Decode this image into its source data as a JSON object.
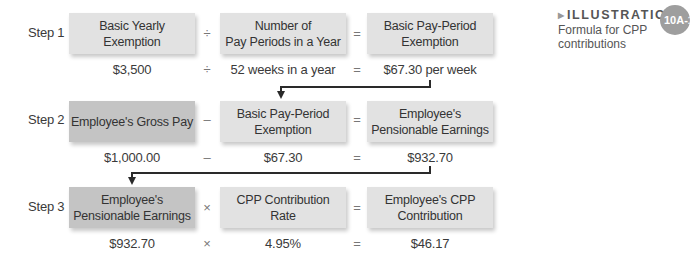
{
  "illustration": {
    "label": "ILLUSTRATION",
    "number": "10A-1",
    "subtitle_line1": "Formula for CPP",
    "subtitle_line2": "contributions"
  },
  "steps": [
    {
      "label": "Step 1",
      "boxes": [
        {
          "line1": "Basic Yearly",
          "line2": "Exemption",
          "shade": "light"
        },
        {
          "line1": "Number of",
          "line2": "Pay Periods in a Year",
          "shade": "light"
        },
        {
          "line1": "Basic Pay-Period",
          "line2": "Exemption",
          "shade": "light"
        }
      ],
      "operators": [
        "÷",
        "="
      ],
      "values": [
        "$3,500",
        "52 weeks in a year",
        "$67.30 per week"
      ],
      "value_operators": [
        "÷",
        "="
      ]
    },
    {
      "label": "Step 2",
      "boxes": [
        {
          "line1": "Employee's Gross Pay",
          "line2": "",
          "shade": "dark"
        },
        {
          "line1": "Basic Pay-Period",
          "line2": "Exemption",
          "shade": "light"
        },
        {
          "line1": "Employee's",
          "line2": "Pensionable Earnings",
          "shade": "light"
        }
      ],
      "operators": [
        "–",
        "="
      ],
      "values": [
        "$1,000.00",
        "$67.30",
        "$932.70"
      ],
      "value_operators": [
        "–",
        "="
      ]
    },
    {
      "label": "Step 3",
      "boxes": [
        {
          "line1": "Employee's",
          "line2": "Pensionable Earnings",
          "shade": "dark"
        },
        {
          "line1": "CPP Contribution",
          "line2": "Rate",
          "shade": "light"
        },
        {
          "line1": "Employee's CPP",
          "line2": "Contribution",
          "shade": "light"
        }
      ],
      "operators": [
        "×",
        "="
      ],
      "values": [
        "$932.70",
        "4.95%",
        "$46.17"
      ],
      "value_operators": [
        "×",
        "="
      ]
    }
  ],
  "colors": {
    "box_light": "#e2e2e2",
    "box_dark": "#c4c4c4",
    "connector": "#2a2a2a",
    "badge": "#9e9e9e"
  }
}
